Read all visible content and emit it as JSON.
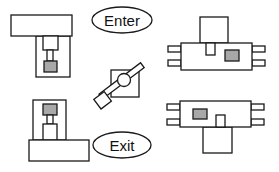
{
  "diagram": {
    "labels": {
      "enter": "Enter",
      "exit": "Exit"
    },
    "colors": {
      "stroke": "#1a1a1a",
      "fill": "#ffffff",
      "sensor_fill": "#a8a8a8"
    },
    "components": [
      {
        "name": "upper-left-fixture"
      },
      {
        "name": "lower-left-fixture"
      },
      {
        "name": "upper-right-fixture"
      },
      {
        "name": "lower-right-fixture"
      },
      {
        "name": "center-rotating-arm"
      }
    ]
  }
}
